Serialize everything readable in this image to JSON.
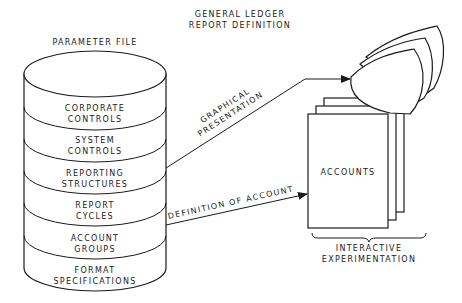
{
  "title": {
    "line1": "GENERAL LEDGER",
    "line2": "REPORT DEFINITION"
  },
  "parameter_file": {
    "label": "PARAMETER FILE",
    "layers": [
      {
        "line1": "CORPORATE",
        "line2": "CONTROLS"
      },
      {
        "line1": "SYSTEM",
        "line2": "CONTROLS"
      },
      {
        "line1": "REPORTING",
        "line2": "STRUCTURES"
      },
      {
        "line1": "REPORT",
        "line2": "CYCLES"
      },
      {
        "line1": "ACCOUNT",
        "line2": "GROUPS"
      },
      {
        "line1": "FORMAT",
        "line2": "SPECIFICATIONS"
      }
    ]
  },
  "arrows": {
    "graphical": {
      "line1": "GRAPHICAL",
      "line2": "PRESENTATION"
    },
    "definition": {
      "label": "DEFINITION OF ACCOUNT"
    }
  },
  "accounts": {
    "label": "ACCOUNTS"
  },
  "interactive": {
    "line1": "INTERACTIVE",
    "line2": "EXPERIMENTATION"
  },
  "colors": {
    "ink": "#1a1a1a",
    "paper": "#ffffff"
  }
}
